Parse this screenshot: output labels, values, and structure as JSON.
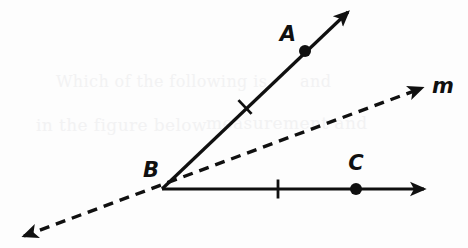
{
  "figure": {
    "kind": "geometry-diagram",
    "background_color": "#fdfdfd",
    "stroke_color": "#101010",
    "width": 468,
    "height": 248
  },
  "labels": {
    "point_a": "A",
    "point_b": "B",
    "point_c": "C",
    "line_m": "m"
  },
  "label_positions": {
    "point_a": {
      "x": 288,
      "y": 35
    },
    "point_b": {
      "x": 151,
      "y": 171
    },
    "point_c": {
      "x": 356,
      "y": 164
    },
    "line_m": {
      "x": 443,
      "y": 87
    }
  },
  "points": {
    "vertex_b": {
      "x": 162,
      "y": 189
    },
    "point_a_dot": {
      "x": 305,
      "y": 51
    },
    "point_c_dot": {
      "x": 356,
      "y": 189
    },
    "dot_radius": 6
  },
  "rays": {
    "ray_ba": {
      "name": "ray-ba",
      "from": {
        "x": 162,
        "y": 189
      },
      "to": {
        "x": 348,
        "y": 12
      },
      "style": "solid",
      "arrow": "end",
      "stroke_width": 3.2
    },
    "ray_bc": {
      "name": "ray-bc",
      "from": {
        "x": 162,
        "y": 189
      },
      "to": {
        "x": 424,
        "y": 189
      },
      "style": "solid",
      "arrow": "end",
      "stroke_width": 3.2
    },
    "line_m": {
      "name": "line-m",
      "from": {
        "x": 24,
        "y": 236
      },
      "to": {
        "x": 422,
        "y": 88
      },
      "style": "dashed",
      "dash_pattern": "10 7",
      "arrow": "both",
      "stroke_width": 3.4
    }
  },
  "tick_marks": [
    {
      "name": "tick-on-ray-ba",
      "x": 245,
      "y": 107,
      "angle_deg": -43.6,
      "length": 19,
      "stroke_width": 2.8
    },
    {
      "name": "tick-on-ray-bc",
      "x": 278,
      "y": 189,
      "angle_deg": 0,
      "length": 19,
      "stroke_width": 2.8
    }
  ],
  "ghost_text": [
    {
      "text": "in the figure below",
      "x": 36,
      "y": 132,
      "size": 17
    },
    {
      "text": "measurement and",
      "x": 206,
      "y": 130,
      "size": 17
    },
    {
      "text": "Which of the following is",
      "x": 56,
      "y": 88,
      "size": 16
    },
    {
      "text": "and",
      "x": 300,
      "y": 88,
      "size": 16
    }
  ]
}
